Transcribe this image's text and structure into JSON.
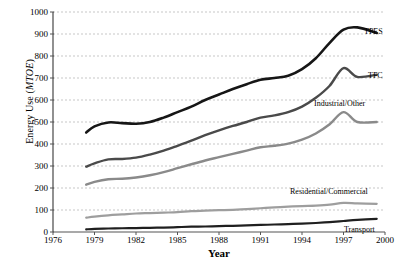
{
  "chart_data": {
    "type": "line",
    "title": "",
    "xlabel": "Year",
    "ylabel": "Energy Use (MTOE)",
    "ylabel_plain": "Energy Use (",
    "ylabel_italic": "MTOE",
    "ylabel_close": ")",
    "xlim": [
      1976,
      2000
    ],
    "ylim": [
      0,
      1000
    ],
    "xticks": [
      1976,
      1979,
      1982,
      1985,
      1988,
      1991,
      1994,
      1997,
      2000
    ],
    "yticks": [
      0,
      100,
      200,
      300,
      400,
      500,
      600,
      700,
      800,
      900,
      1000
    ],
    "grid": "horizontal-dashed",
    "legend": "inline-right-labels",
    "x": [
      1978.4,
      1979,
      1980,
      1981,
      1982,
      1983,
      1984,
      1985,
      1986,
      1987,
      1988,
      1989,
      1990,
      1991,
      1992,
      1993,
      1994,
      1995,
      1996,
      1997,
      1998,
      1999.4
    ],
    "series": [
      {
        "name": "TPES",
        "color": "#161616",
        "width": 2.6,
        "label_x": 364,
        "label_y": 28,
        "values": [
          452,
          480,
          498,
          495,
          492,
          500,
          520,
          545,
          570,
          600,
          625,
          650,
          672,
          692,
          700,
          710,
          740,
          790,
          860,
          920,
          930,
          905
        ]
      },
      {
        "name": "TFC",
        "color": "#4a4a4a",
        "width": 2.4,
        "label_x": 368,
        "label_y": 72,
        "values": [
          297,
          312,
          330,
          332,
          338,
          352,
          370,
          392,
          415,
          440,
          462,
          482,
          500,
          520,
          530,
          545,
          570,
          610,
          665,
          745,
          705,
          715
        ]
      },
      {
        "name": "Industrial/Other",
        "color": "#8a8a8a",
        "width": 2.4,
        "label_x": 314,
        "label_y": 100,
        "values": [
          215,
          228,
          240,
          242,
          248,
          258,
          272,
          290,
          308,
          325,
          340,
          355,
          370,
          385,
          392,
          402,
          420,
          448,
          490,
          545,
          500,
          500
        ]
      },
      {
        "name": "Residential/Commercial",
        "color": "#9e9e9e",
        "width": 2.2,
        "label_x": 290,
        "label_y": 188,
        "values": [
          65,
          70,
          76,
          80,
          84,
          86,
          88,
          90,
          95,
          97,
          99,
          101,
          104,
          108,
          112,
          115,
          118,
          120,
          124,
          132,
          130,
          128
        ]
      },
      {
        "name": "Transport",
        "color": "#1f1f1f",
        "width": 2.2,
        "label_x": 344,
        "label_y": 226,
        "values": [
          12,
          14,
          16,
          17,
          18,
          19,
          20,
          22,
          24,
          25,
          27,
          28,
          30,
          32,
          34,
          36,
          38,
          41,
          45,
          50,
          55,
          60
        ]
      }
    ]
  }
}
